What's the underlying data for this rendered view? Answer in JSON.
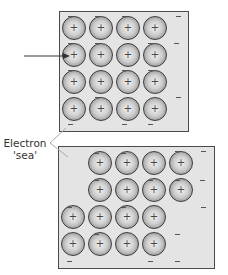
{
  "label": {
    "line1": "Electron",
    "line2": "'sea'"
  },
  "ion_symbol": "+",
  "colors": {
    "sea": "#e4e4e4",
    "border": "#4a4a4a",
    "ion_center": "#f2f2f2",
    "ion_edge": "#7a7a7a",
    "arrow": "#333333"
  },
  "top_lattice": {
    "description": "Regular 4x4 lattice of metal cations in electron sea",
    "rows": 4,
    "cols": 4,
    "ions": [
      [
        74,
        28
      ],
      [
        101,
        28
      ],
      [
        128,
        28
      ],
      [
        155,
        28
      ],
      [
        74,
        55
      ],
      [
        101,
        55
      ],
      [
        128,
        55
      ],
      [
        155,
        55
      ],
      [
        74,
        82
      ],
      [
        101,
        82
      ],
      [
        128,
        82
      ],
      [
        155,
        82
      ],
      [
        74,
        109
      ],
      [
        101,
        109
      ],
      [
        128,
        109
      ],
      [
        155,
        109
      ]
    ],
    "electrons": [
      [
        68,
        16
      ],
      [
        95,
        16
      ],
      [
        122,
        16
      ],
      [
        176,
        16
      ],
      [
        68,
        43
      ],
      [
        95,
        43
      ],
      [
        148,
        43
      ],
      [
        174,
        43
      ],
      [
        68,
        70
      ],
      [
        122,
        70
      ],
      [
        148,
        70
      ],
      [
        95,
        97
      ],
      [
        176,
        97
      ],
      [
        68,
        124
      ],
      [
        122,
        124
      ],
      [
        148,
        124
      ]
    ],
    "arrow": {
      "from": [
        24,
        56
      ],
      "to": [
        70,
        56
      ]
    }
  },
  "bottom_lattice": {
    "description": "Lattice after layers slide (force applied)",
    "ions": [
      [
        100,
        163
      ],
      [
        127,
        163
      ],
      [
        154,
        163
      ],
      [
        181,
        163
      ],
      [
        100,
        190
      ],
      [
        127,
        190
      ],
      [
        154,
        190
      ],
      [
        181,
        190
      ],
      [
        73,
        217
      ],
      [
        100,
        217
      ],
      [
        127,
        217
      ],
      [
        154,
        217
      ],
      [
        73,
        244
      ],
      [
        100,
        244
      ],
      [
        127,
        244
      ],
      [
        154,
        244
      ]
    ],
    "electrons": [
      [
        94,
        153
      ],
      [
        121,
        153
      ],
      [
        175,
        151
      ],
      [
        201,
        151
      ],
      [
        94,
        180
      ],
      [
        148,
        180
      ],
      [
        175,
        180
      ],
      [
        200,
        180
      ],
      [
        67,
        207
      ],
      [
        121,
        207
      ],
      [
        201,
        207
      ],
      [
        94,
        234
      ],
      [
        175,
        234
      ],
      [
        67,
        261
      ],
      [
        148,
        261
      ],
      [
        175,
        261
      ]
    ]
  }
}
